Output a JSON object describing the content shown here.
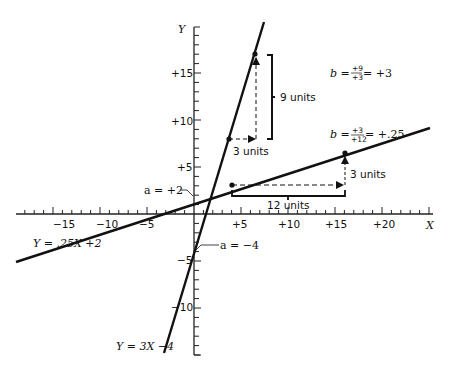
{
  "axes": {
    "x_label": "X",
    "y_label": "Y",
    "x_ticks": [
      {
        "value": -15,
        "label": "−15"
      },
      {
        "value": -10,
        "label": "−10"
      },
      {
        "value": -5,
        "label": "−5"
      },
      {
        "value": 5,
        "label": "+5"
      },
      {
        "value": 10,
        "label": "+10"
      },
      {
        "value": 15,
        "label": "+15"
      },
      {
        "value": 20,
        "label": "+20"
      }
    ],
    "y_ticks": [
      {
        "value": 15,
        "label": "+15"
      },
      {
        "value": 10,
        "label": "+10"
      },
      {
        "value": 5,
        "label": "+5"
      },
      {
        "value": -5,
        "label": "−5"
      },
      {
        "value": -10,
        "label": "−10"
      }
    ],
    "xlim": [
      -19,
      25
    ],
    "ylim": [
      -15,
      19.5
    ]
  },
  "lines": {
    "steep": {
      "equation": "Y = 3X −4",
      "intercept_label": "a = −4",
      "slope_label": {
        "prefix": "b =",
        "num": "+9",
        "den": "+3",
        "suffix": "= +3"
      },
      "run_label": "3 units",
      "rise_label": "9 units"
    },
    "shallow": {
      "equation": "Y = .25X +2",
      "intercept_label": "a = +2",
      "slope_label": {
        "prefix": "b =",
        "num": "+3",
        "den": "+12",
        "suffix": "= +.25"
      },
      "run_label": "12 units",
      "rise_label": "3 units"
    }
  },
  "chart_data": {
    "type": "line",
    "title": "",
    "xlabel": "X",
    "ylabel": "Y",
    "xlim": [
      -19,
      25
    ],
    "ylim": [
      -15,
      19.5
    ],
    "grid": false,
    "series": [
      {
        "name": "Y = 3X −4",
        "intercept": -4,
        "slope": 3,
        "x": [
          -3.2,
          7.5
        ],
        "y": [
          -13.6,
          18.5
        ],
        "highlighted_points": [
          [
            4,
            8
          ],
          [
            7,
            17
          ]
        ],
        "run": 3,
        "rise": 9
      },
      {
        "name": "Y = .25X +2",
        "intercept": 2,
        "slope": 0.25,
        "x": [
          -19,
          25
        ],
        "y": [
          -2.75,
          8.25
        ],
        "highlighted_points": [
          [
            4,
            3
          ],
          [
            16,
            6
          ]
        ],
        "run": 12,
        "rise": 3
      }
    ],
    "annotations": [
      "a = +2",
      "a = −4",
      "b = (+9)/(+3) = +3",
      "b = (+3)/(+12) = +.25",
      "3 units",
      "9 units",
      "12 units",
      "3 units"
    ]
  }
}
